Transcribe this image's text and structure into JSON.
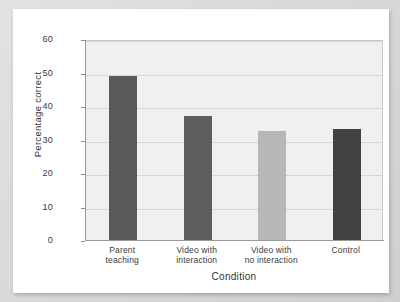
{
  "chart_data": {
    "type": "bar",
    "title": "",
    "subtitle": "",
    "xlabel": "Condition",
    "ylabel": "Percentage correct",
    "categories": [
      "Parent\nteaching",
      "Video with\ninteraction",
      "Video with\nno interaction",
      "Control"
    ],
    "category_lines": [
      [
        "Parent",
        "teaching"
      ],
      [
        "Video with",
        "interaction"
      ],
      [
        "Video with",
        "no interaction"
      ],
      [
        "Control"
      ]
    ],
    "values": [
      49,
      37,
      32.5,
      33
    ],
    "bar_colors": [
      "#595959",
      "#5d5d5d",
      "#b7b7b7",
      "#424242"
    ],
    "ylim": [
      0,
      60
    ],
    "yticks": [
      0,
      10,
      20,
      30,
      40,
      50,
      60
    ],
    "ytick_labels": [
      "0",
      "10",
      "20",
      "30",
      "40",
      "50",
      "60"
    ],
    "grid": true,
    "grid_axis": "y",
    "legend": "none",
    "plot_background": "#f0f0f0",
    "figure_background": "#ffffff"
  },
  "figure": {
    "card_background": "#ffffff",
    "outer_background": "#d9d9d9"
  }
}
